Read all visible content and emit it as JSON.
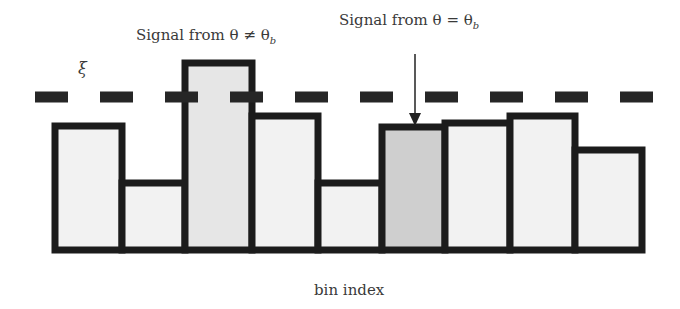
{
  "labels": {
    "signal_other": "Signal from θ ≠ θ",
    "signal_other_sub": "b",
    "signal_match": "Signal from θ = θ",
    "signal_match_sub": "b",
    "threshold": "ξ",
    "xlabel": "bin index"
  },
  "colors": {
    "outline": "#1c1c1c",
    "bar_fill": "#f2f2f2",
    "tall_bar_fill": "#e6e6e6",
    "target_bar_fill": "#cfcfcf",
    "dash": "#262626",
    "text": "#3a3a3a"
  },
  "chart_data": {
    "type": "bar",
    "title": "",
    "xlabel": "bin index",
    "ylabel": "",
    "categories": [
      "1",
      "2",
      "3",
      "4",
      "5",
      "6",
      "7",
      "8",
      "9"
    ],
    "values": [
      0.68,
      0.36,
      1.04,
      0.74,
      0.36,
      0.68,
      0.7,
      0.74,
      0.55
    ],
    "threshold": {
      "label": "ξ",
      "value": 0.84,
      "style": "dashed"
    },
    "annotations": [
      {
        "text": "Signal from θ ≠ θ_b",
        "bin": 3
      },
      {
        "text": "Signal from θ = θ_b",
        "bin": 6,
        "arrow": true
      }
    ],
    "highlighted_bin": 6,
    "grid": false,
    "legend": "none"
  },
  "geometry": {
    "baseline_y": 250,
    "bars": [
      {
        "x": 55,
        "w": 67,
        "top": 126
      },
      {
        "x": 122,
        "w": 63,
        "top": 183
      },
      {
        "x": 185,
        "w": 67,
        "top": 63
      },
      {
        "x": 252,
        "w": 66,
        "top": 116
      },
      {
        "x": 318,
        "w": 64,
        "top": 183
      },
      {
        "x": 382,
        "w": 63,
        "top": 127
      },
      {
        "x": 445,
        "w": 65,
        "top": 123
      },
      {
        "x": 510,
        "w": 65,
        "top": 116
      },
      {
        "x": 575,
        "w": 67,
        "top": 150
      }
    ],
    "dash_y": 97
  }
}
